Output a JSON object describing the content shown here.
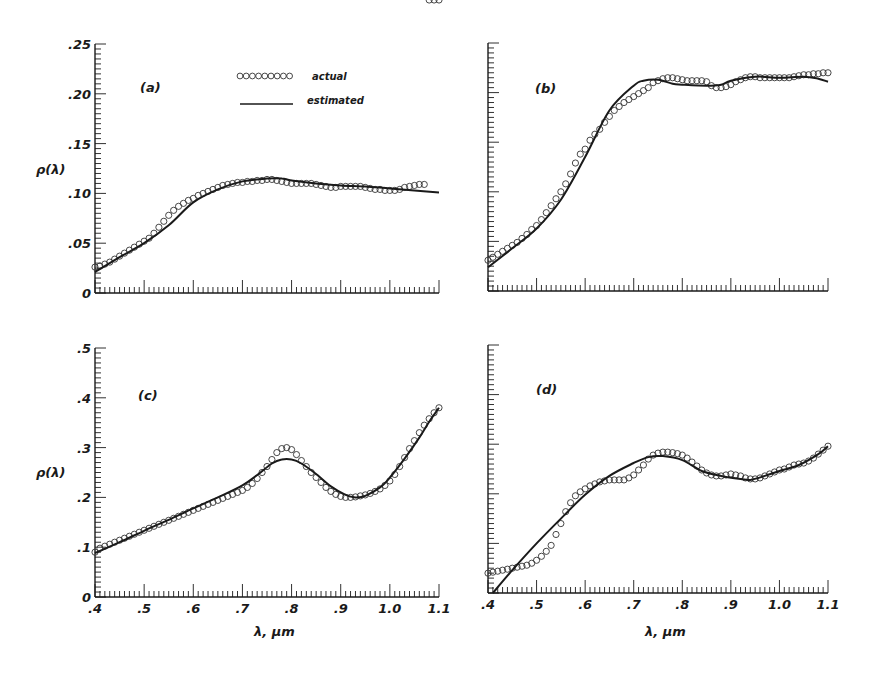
{
  "figure": {
    "legend": {
      "actual_label": "actual",
      "estimated_label": "estimated"
    },
    "y_axis_title": "ρ(λ)",
    "x_axis_title": "λ, μm"
  },
  "chart_data": [
    {
      "id": "a",
      "type": "line",
      "panel_label": "(a)",
      "title": "",
      "xlabel": "",
      "ylabel": "ρ(λ)",
      "xlim": [
        0.4,
        1.1
      ],
      "ylim": [
        0,
        0.25
      ],
      "y_ticks": [
        0,
        0.05,
        0.1,
        0.15,
        0.2,
        0.25
      ],
      "y_tick_labels": [
        "0",
        ".05",
        ".10",
        ".15",
        ".20",
        ".25"
      ],
      "x_ticks": [
        0.4,
        0.5,
        0.6,
        0.7,
        0.8,
        0.9,
        1.0,
        1.1
      ],
      "x_tick_labels": [],
      "show_y_labels": true,
      "show_x_labels": false,
      "legend": {
        "visible": true,
        "position": "top-center",
        "entries": [
          "actual",
          "estimated"
        ]
      },
      "grid": false,
      "series": [
        {
          "name": "actual",
          "style": "open-circles",
          "x": [
            0.4,
            0.41,
            0.42,
            0.43,
            0.44,
            0.45,
            0.46,
            0.47,
            0.48,
            0.49,
            0.5,
            0.51,
            0.52,
            0.53,
            0.54,
            0.55,
            0.56,
            0.57,
            0.58,
            0.59,
            0.6,
            0.61,
            0.62,
            0.63,
            0.64,
            0.65,
            0.66,
            0.67,
            0.68,
            0.69,
            0.7,
            0.71,
            0.72,
            0.73,
            0.74,
            0.75,
            0.76,
            0.77,
            0.78,
            0.79,
            0.8,
            0.81,
            0.82,
            0.83,
            0.84,
            0.85,
            0.86,
            0.87,
            0.88,
            0.89,
            0.9,
            0.91,
            0.92,
            0.93,
            0.94,
            0.95,
            0.96,
            0.97,
            0.98,
            0.99,
            1.0,
            1.01,
            1.02,
            1.03,
            1.04,
            1.05,
            1.06,
            1.07,
            1.08,
            1.09,
            1.1
          ],
          "values": [
            0.026,
            0.027,
            0.029,
            0.031,
            0.034,
            0.037,
            0.04,
            0.043,
            0.046,
            0.049,
            0.052,
            0.055,
            0.06,
            0.066,
            0.072,
            0.078,
            0.083,
            0.087,
            0.09,
            0.093,
            0.095,
            0.098,
            0.1,
            0.102,
            0.104,
            0.106,
            0.108,
            0.109,
            0.11,
            0.111,
            0.111,
            0.112,
            0.112,
            0.113,
            0.113,
            0.114,
            0.114,
            0.113,
            0.112,
            0.111,
            0.11,
            0.11,
            0.11,
            0.11,
            0.11,
            0.109,
            0.108,
            0.107,
            0.106,
            0.106,
            0.107,
            0.107,
            0.107,
            0.107,
            0.107,
            0.106,
            0.105,
            0.104,
            0.104,
            0.103,
            0.103,
            0.103,
            0.104,
            0.106,
            0.107,
            0.108,
            0.109,
            0.109
          ]
        },
        {
          "name": "estimated",
          "style": "solid-line",
          "x": [
            0.4,
            0.45,
            0.5,
            0.55,
            0.6,
            0.65,
            0.7,
            0.75,
            0.78,
            0.8,
            0.85,
            0.9,
            0.95,
            1.0,
            1.05,
            1.1
          ],
          "values": [
            0.021,
            0.036,
            0.05,
            0.068,
            0.091,
            0.104,
            0.112,
            0.115,
            0.115,
            0.113,
            0.11,
            0.108,
            0.107,
            0.105,
            0.103,
            0.101
          ]
        }
      ]
    },
    {
      "id": "b",
      "type": "line",
      "panel_label": "(b)",
      "title": "",
      "xlabel": "",
      "ylabel": "",
      "xlim": [
        0.4,
        1.1
      ],
      "ylim": [
        0,
        0.25
      ],
      "y_ticks": [
        0,
        0.05,
        0.1,
        0.15,
        0.2,
        0.25
      ],
      "y_tick_labels": [],
      "x_ticks": [
        0.4,
        0.5,
        0.6,
        0.7,
        0.8,
        0.9,
        1.0,
        1.1
      ],
      "x_tick_labels": [],
      "show_y_labels": false,
      "show_x_labels": false,
      "grid": false,
      "series": [
        {
          "name": "actual",
          "style": "open-circles",
          "x": [
            0.4,
            0.41,
            0.42,
            0.43,
            0.44,
            0.45,
            0.46,
            0.47,
            0.48,
            0.49,
            0.5,
            0.51,
            0.52,
            0.53,
            0.54,
            0.55,
            0.56,
            0.57,
            0.58,
            0.59,
            0.6,
            0.61,
            0.62,
            0.63,
            0.64,
            0.65,
            0.66,
            0.67,
            0.68,
            0.69,
            0.7,
            0.71,
            0.72,
            0.73,
            0.74,
            0.75,
            0.76,
            0.77,
            0.78,
            0.79,
            0.8,
            0.81,
            0.82,
            0.83,
            0.84,
            0.85,
            0.86,
            0.87,
            0.88,
            0.89,
            0.9,
            0.91,
            0.92,
            0.93,
            0.94,
            0.95,
            0.96,
            0.97,
            0.98,
            0.99,
            1.0,
            1.01,
            1.02,
            1.03,
            1.04,
            1.05,
            1.06,
            1.07,
            1.08,
            1.09,
            1.1
          ],
          "values": [
            0.031,
            0.034,
            0.037,
            0.04,
            0.043,
            0.046,
            0.049,
            0.053,
            0.057,
            0.062,
            0.066,
            0.072,
            0.079,
            0.086,
            0.093,
            0.1,
            0.108,
            0.118,
            0.129,
            0.138,
            0.143,
            0.152,
            0.158,
            0.163,
            0.17,
            0.176,
            0.182,
            0.186,
            0.19,
            0.193,
            0.196,
            0.199,
            0.202,
            0.205,
            0.21,
            0.212,
            0.214,
            0.215,
            0.215,
            0.214,
            0.213,
            0.212,
            0.212,
            0.212,
            0.212,
            0.211,
            0.207,
            0.205,
            0.205,
            0.206,
            0.208,
            0.211,
            0.213,
            0.215,
            0.216,
            0.216,
            0.215,
            0.215,
            0.215,
            0.215,
            0.215,
            0.215,
            0.215,
            0.216,
            0.217,
            0.218,
            0.218,
            0.219,
            0.219,
            0.22,
            0.22
          ]
        },
        {
          "name": "estimated",
          "style": "solid-line",
          "x": [
            0.4,
            0.45,
            0.5,
            0.55,
            0.6,
            0.65,
            0.7,
            0.72,
            0.75,
            0.78,
            0.8,
            0.85,
            0.88,
            0.9,
            0.95,
            1.0,
            1.05,
            1.08,
            1.1
          ],
          "values": [
            0.024,
            0.043,
            0.063,
            0.092,
            0.135,
            0.182,
            0.207,
            0.212,
            0.213,
            0.209,
            0.208,
            0.207,
            0.208,
            0.212,
            0.216,
            0.215,
            0.216,
            0.214,
            0.211
          ]
        }
      ]
    },
    {
      "id": "c",
      "type": "line",
      "panel_label": "(c)",
      "title": "",
      "xlabel": "λ, μm",
      "ylabel": "ρ(λ)",
      "xlim": [
        0.4,
        1.1
      ],
      "ylim": [
        0,
        0.5
      ],
      "y_ticks": [
        0,
        0.1,
        0.2,
        0.3,
        0.4,
        0.5
      ],
      "y_tick_labels": [
        "0",
        ".1",
        ".2",
        ".3",
        ".4",
        ".5"
      ],
      "x_ticks": [
        0.4,
        0.5,
        0.6,
        0.7,
        0.8,
        0.9,
        1.0,
        1.1
      ],
      "x_tick_labels": [
        ".4",
        ".5",
        ".6",
        ".7",
        ".8",
        ".9",
        "1.0",
        "1.1"
      ],
      "show_y_labels": true,
      "show_x_labels": true,
      "grid": false,
      "series": [
        {
          "name": "actual",
          "style": "open-circles",
          "x": [
            0.4,
            0.41,
            0.42,
            0.43,
            0.44,
            0.45,
            0.46,
            0.47,
            0.48,
            0.49,
            0.5,
            0.51,
            0.52,
            0.53,
            0.54,
            0.55,
            0.56,
            0.57,
            0.58,
            0.59,
            0.6,
            0.61,
            0.62,
            0.63,
            0.64,
            0.65,
            0.66,
            0.67,
            0.68,
            0.69,
            0.7,
            0.71,
            0.72,
            0.73,
            0.74,
            0.75,
            0.76,
            0.77,
            0.78,
            0.79,
            0.8,
            0.81,
            0.82,
            0.83,
            0.84,
            0.85,
            0.86,
            0.87,
            0.88,
            0.89,
            0.9,
            0.91,
            0.92,
            0.93,
            0.94,
            0.95,
            0.96,
            0.97,
            0.98,
            0.99,
            1.0,
            1.01,
            1.02,
            1.03,
            1.04,
            1.05,
            1.06,
            1.07,
            1.08,
            1.09,
            1.1
          ],
          "values": [
            0.09,
            0.098,
            0.102,
            0.106,
            0.11,
            0.114,
            0.118,
            0.122,
            0.126,
            0.13,
            0.134,
            0.138,
            0.142,
            0.146,
            0.15,
            0.154,
            0.158,
            0.162,
            0.166,
            0.17,
            0.174,
            0.178,
            0.182,
            0.186,
            0.19,
            0.194,
            0.198,
            0.202,
            0.206,
            0.21,
            0.214,
            0.22,
            0.228,
            0.238,
            0.25,
            0.262,
            0.276,
            0.29,
            0.298,
            0.3,
            0.296,
            0.286,
            0.274,
            0.262,
            0.25,
            0.24,
            0.23,
            0.22,
            0.212,
            0.206,
            0.202,
            0.2,
            0.2,
            0.201,
            0.203,
            0.205,
            0.208,
            0.212,
            0.217,
            0.224,
            0.233,
            0.246,
            0.262,
            0.28,
            0.298,
            0.314,
            0.33,
            0.345,
            0.358,
            0.37,
            0.38
          ]
        },
        {
          "name": "estimated",
          "style": "solid-line",
          "x": [
            0.4,
            0.45,
            0.5,
            0.55,
            0.6,
            0.65,
            0.7,
            0.73,
            0.76,
            0.78,
            0.8,
            0.82,
            0.85,
            0.88,
            0.91,
            0.93,
            0.95,
            0.98,
            1.0,
            1.03,
            1.06,
            1.08,
            1.1
          ],
          "values": [
            0.088,
            0.11,
            0.133,
            0.155,
            0.178,
            0.2,
            0.224,
            0.245,
            0.268,
            0.276,
            0.276,
            0.268,
            0.247,
            0.222,
            0.205,
            0.2,
            0.203,
            0.22,
            0.24,
            0.278,
            0.32,
            0.352,
            0.38
          ]
        }
      ]
    },
    {
      "id": "d",
      "type": "line",
      "panel_label": "(d)",
      "title": "",
      "xlabel": "λ, μm",
      "ylabel": "",
      "xlim": [
        0.4,
        1.1
      ],
      "ylim": [
        0,
        0.5
      ],
      "y_ticks": [
        0,
        0.1,
        0.2,
        0.3,
        0.4,
        0.5
      ],
      "y_tick_labels": [],
      "x_ticks": [
        0.4,
        0.5,
        0.6,
        0.7,
        0.8,
        0.9,
        1.0,
        1.1
      ],
      "x_tick_labels": [
        ".4",
        ".5",
        ".6",
        ".7",
        ".8",
        ".9",
        "1.0",
        "1.1"
      ],
      "show_y_labels": false,
      "show_x_labels": true,
      "grid": false,
      "series": [
        {
          "name": "actual",
          "style": "open-circles",
          "x": [
            0.4,
            0.41,
            0.42,
            0.43,
            0.44,
            0.45,
            0.46,
            0.47,
            0.48,
            0.49,
            0.5,
            0.51,
            0.52,
            0.53,
            0.54,
            0.55,
            0.56,
            0.57,
            0.58,
            0.59,
            0.6,
            0.61,
            0.62,
            0.63,
            0.64,
            0.65,
            0.66,
            0.67,
            0.68,
            0.69,
            0.7,
            0.71,
            0.72,
            0.73,
            0.74,
            0.75,
            0.76,
            0.77,
            0.78,
            0.79,
            0.8,
            0.81,
            0.82,
            0.83,
            0.84,
            0.85,
            0.86,
            0.87,
            0.88,
            0.89,
            0.9,
            0.91,
            0.92,
            0.93,
            0.94,
            0.95,
            0.96,
            0.97,
            0.98,
            0.99,
            1.0,
            1.01,
            1.02,
            1.03,
            1.04,
            1.05,
            1.06,
            1.07,
            1.08,
            1.09,
            1.1
          ],
          "values": [
            0.04,
            0.042,
            0.044,
            0.046,
            0.048,
            0.05,
            0.052,
            0.054,
            0.056,
            0.06,
            0.066,
            0.074,
            0.084,
            0.096,
            0.118,
            0.14,
            0.164,
            0.182,
            0.196,
            0.204,
            0.21,
            0.216,
            0.22,
            0.224,
            0.226,
            0.228,
            0.228,
            0.228,
            0.228,
            0.232,
            0.238,
            0.248,
            0.258,
            0.27,
            0.278,
            0.282,
            0.284,
            0.284,
            0.283,
            0.281,
            0.278,
            0.272,
            0.264,
            0.256,
            0.248,
            0.242,
            0.238,
            0.236,
            0.236,
            0.238,
            0.24,
            0.238,
            0.236,
            0.232,
            0.23,
            0.23,
            0.232,
            0.236,
            0.24,
            0.244,
            0.248,
            0.25,
            0.254,
            0.258,
            0.26,
            0.262,
            0.266,
            0.272,
            0.28,
            0.288,
            0.296
          ]
        },
        {
          "name": "estimated",
          "style": "solid-line",
          "x": [
            0.41,
            0.45,
            0.5,
            0.55,
            0.6,
            0.65,
            0.7,
            0.73,
            0.76,
            0.8,
            0.84,
            0.88,
            0.92,
            0.94,
            0.97,
            1.0,
            1.04,
            1.08,
            1.1
          ],
          "values": [
            0.0,
            0.046,
            0.1,
            0.15,
            0.198,
            0.236,
            0.262,
            0.274,
            0.276,
            0.268,
            0.246,
            0.236,
            0.23,
            0.228,
            0.236,
            0.246,
            0.258,
            0.28,
            0.296
          ]
        }
      ]
    }
  ]
}
